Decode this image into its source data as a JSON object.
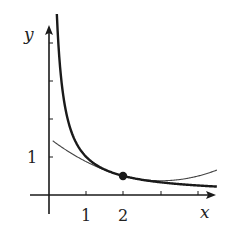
{
  "chart_data": {
    "type": "line",
    "title": "",
    "xlabel": "x",
    "ylabel": "y",
    "x_tick_labels": [
      "1",
      "2"
    ],
    "y_tick_labels": [
      "1"
    ],
    "x_ticks": [
      1,
      2,
      3,
      4
    ],
    "y_ticks": [
      1,
      2,
      3,
      4
    ],
    "xlim": [
      -0.5,
      4.5
    ],
    "ylim": [
      -0.5,
      4.5
    ],
    "series": [
      {
        "name": "y = 1/x",
        "style": "thick",
        "function": "1/x",
        "x_range": [
          0.21,
          4.5
        ]
      },
      {
        "name": "quadratic approximation at x=2",
        "style": "thin",
        "function": "1/2 - (x-2)/4 + (x-2)^2/8",
        "x_range": [
          0.1,
          4.5
        ]
      }
    ],
    "marked_point": {
      "x": 2,
      "y": 0.5
    },
    "grid": false,
    "legend": "none"
  },
  "labels": {
    "x_axis": "x",
    "y_axis": "y",
    "tick_x1": "1",
    "tick_x2": "2",
    "tick_y1": "1"
  },
  "colors": {
    "ink": "#1a1a1a",
    "thin_curve": "#444444",
    "background": "#ffffff"
  }
}
